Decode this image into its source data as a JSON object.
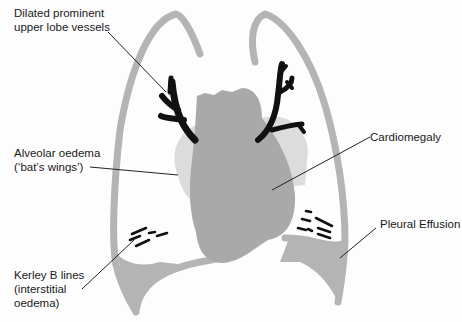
{
  "diagram": {
    "labels": {
      "upper_lobe_vessels": {
        "line1": "Dilated prominent",
        "line2": "upper lobe vessels"
      },
      "alveolar_oedema": {
        "line1": "Alveolar oedema",
        "line2": "(‘bat’s wings’)"
      },
      "cardiomegaly": {
        "line1": "Cardiomegaly"
      },
      "kerley_b": {
        "line1": "Kerley B lines",
        "line2": "(interstitial",
        "line3": "oedema)"
      },
      "pleural_effusion": {
        "line1": "Pleural Effusion"
      }
    },
    "colors": {
      "lung_outline": "#b4b4b4",
      "heart": "#a9a9a9",
      "oedema": "#d9d9d9",
      "vessels": "#111111",
      "leader_lines": "#222222",
      "text": "#1a1a1a"
    }
  }
}
